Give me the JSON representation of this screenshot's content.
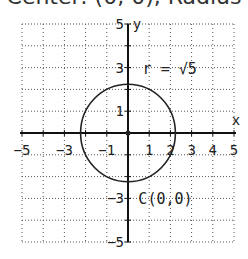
{
  "header": {
    "caption": "Center: (0, 0), Radius"
  },
  "chart_data": {
    "type": "scatter",
    "title": "Center: (0, 0), Radius",
    "xlabel": "x",
    "ylabel": "y",
    "xlim": [
      -5,
      5
    ],
    "ylim": [
      -5,
      5
    ],
    "grid": true,
    "x_ticks": [
      -5,
      -3,
      -1,
      1,
      2,
      3,
      4,
      5
    ],
    "x_tick_labels": [
      "-5",
      "-3",
      "-1",
      "1",
      "2",
      "3",
      "4",
      "5"
    ],
    "y_ticks": [
      5,
      3,
      1,
      -3,
      -5
    ],
    "y_tick_labels": [
      "5",
      "3",
      "1",
      "-3",
      "-5"
    ],
    "circle": {
      "center": [
        0,
        0
      ],
      "radius": 2.2360679775
    },
    "center_point": [
      0,
      0
    ],
    "annotations": [
      {
        "text": "r = √5",
        "x": 0.5,
        "y": 3
      },
      {
        "text": "C(0,0)",
        "x": 0.3,
        "y": -3
      }
    ],
    "colors": {
      "curve": "#222222",
      "grid": "#555555",
      "axis": "#111111"
    }
  }
}
